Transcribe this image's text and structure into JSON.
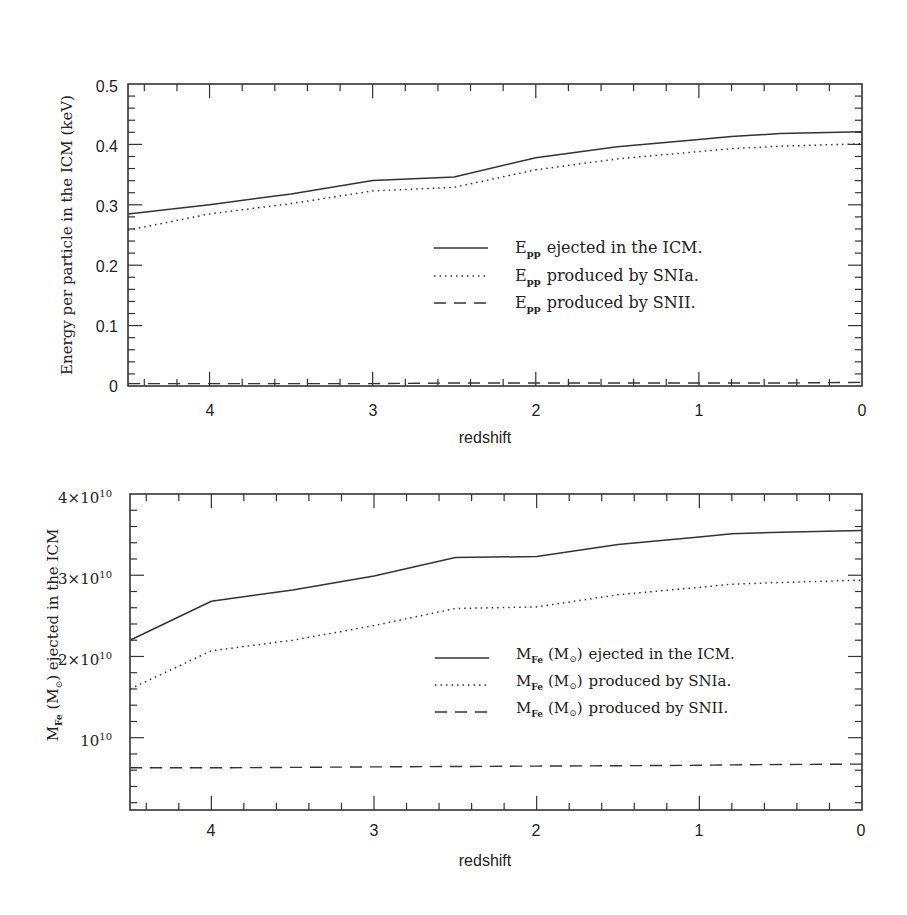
{
  "chart_data": [
    {
      "type": "line",
      "title": "",
      "xlabel": "redshift",
      "ylabel": "Energy per particle in the ICM (keV)",
      "xlim": [
        4.5,
        0
      ],
      "ylim": [
        0,
        0.5
      ],
      "x_ticks": [
        "4",
        "3",
        "2",
        "1",
        "0"
      ],
      "y_ticks": [
        "0",
        "0.1",
        "0.2",
        "0.3",
        "0.4",
        "0.5"
      ],
      "grid": false,
      "legend_position": "center-right",
      "x": [
        4.5,
        4.0,
        3.5,
        3.0,
        2.5,
        2.0,
        1.5,
        1.0,
        0.8,
        0.5,
        0.0
      ],
      "series": [
        {
          "name": "E_pp ejected in the ICM.",
          "style": "solid",
          "values": [
            0.285,
            0.3,
            0.318,
            0.34,
            0.346,
            0.378,
            0.396,
            0.408,
            0.413,
            0.418,
            0.421
          ]
        },
        {
          "name": "E_pp produced by SNIa.",
          "style": "dotted",
          "values": [
            0.258,
            0.285,
            0.302,
            0.323,
            0.329,
            0.358,
            0.376,
            0.388,
            0.393,
            0.397,
            0.401
          ]
        },
        {
          "name": "E_pp produced by SNII.",
          "style": "dashed",
          "values": [
            0.004,
            0.004,
            0.004,
            0.004,
            0.005,
            0.005,
            0.005,
            0.005,
            0.005,
            0.005,
            0.006
          ]
        }
      ]
    },
    {
      "type": "line",
      "title": "",
      "xlabel": "redshift",
      "ylabel": "M_Fe (M_sun) ejected in the ICM",
      "xlim": [
        4.5,
        0
      ],
      "ylim": [
        1100000000.0,
        40000000000.0
      ],
      "x_ticks": [
        "4",
        "3",
        "2",
        "1",
        "0"
      ],
      "y_ticks": [
        "10^10",
        "2×10^10",
        "3×10^10",
        "4×10^10"
      ],
      "grid": false,
      "legend_position": "center-right",
      "x": [
        4.5,
        4.0,
        3.5,
        3.0,
        2.5,
        2.0,
        1.5,
        1.0,
        0.8,
        0.5,
        0.0
      ],
      "series": [
        {
          "name": "M_Fe (M_sun) ejected in the ICM.",
          "style": "solid",
          "values": [
            22000000000.0,
            26800000000.0,
            28200000000.0,
            29900000000.0,
            32200000000.0,
            32300000000.0,
            33800000000.0,
            34700000000.0,
            35100000000.0,
            35300000000.0,
            35500000000.0
          ]
        },
        {
          "name": "M_Fe (M_sun) produced by SNIa.",
          "style": "dotted",
          "values": [
            16000000000.0,
            20700000000.0,
            22000000000.0,
            23800000000.0,
            25900000000.0,
            26100000000.0,
            27600000000.0,
            28500000000.0,
            28900000000.0,
            29100000000.0,
            29400000000.0
          ]
        },
        {
          "name": "M_Fe (M_sun) produced by SNII.",
          "style": "dashed",
          "values": [
            6300000000.0,
            6300000000.0,
            6350000000.0,
            6400000000.0,
            6450000000.0,
            6500000000.0,
            6550000000.0,
            6600000000.0,
            6650000000.0,
            6700000000.0,
            6750000000.0
          ]
        }
      ]
    }
  ],
  "top_plot": {
    "ylabel": "Energy per particle in the ICM (keV)",
    "xlabel": "redshift",
    "y_ticks": [
      "0",
      "0.1",
      "0.2",
      "0.3",
      "0.4",
      "0.5"
    ],
    "x_ticks": [
      "4",
      "3",
      "2",
      "1",
      "0"
    ],
    "legend": [
      {
        "sym": "E",
        "sub": "pp",
        "text": "ejected in the ICM."
      },
      {
        "sym": "E",
        "sub": "pp",
        "text": "produced by SNIa."
      },
      {
        "sym": "E",
        "sub": "pp",
        "text": "produced by SNII."
      }
    ]
  },
  "bottom_plot": {
    "ylabel_pre": "M",
    "ylabel_sub": "Fe",
    "ylabel_mid": " (M",
    "ylabel_sun": "⊙",
    "ylabel_post": ") ejected in the ICM",
    "xlabel": "redshift",
    "y_ticks": [
      {
        "mant": "4×10",
        "exp": "10"
      },
      {
        "mant": "3×10",
        "exp": "10"
      },
      {
        "mant": "2×10",
        "exp": "10"
      },
      {
        "mant": "10",
        "exp": "10"
      }
    ],
    "x_ticks": [
      "4",
      "3",
      "2",
      "1",
      "0"
    ],
    "legend": [
      {
        "sym": "M",
        "sub": "Fe",
        "unit": "(M",
        "sun": "⊙",
        "close": ")",
        "text": "ejected in the ICM."
      },
      {
        "sym": "M",
        "sub": "Fe",
        "unit": "(M",
        "sun": "⊙",
        "close": ")",
        "text": "produced by SNIa."
      },
      {
        "sym": "M",
        "sub": "Fe",
        "unit": "(M",
        "sun": "⊙",
        "close": ")",
        "text": "produced by SNII."
      }
    ]
  }
}
